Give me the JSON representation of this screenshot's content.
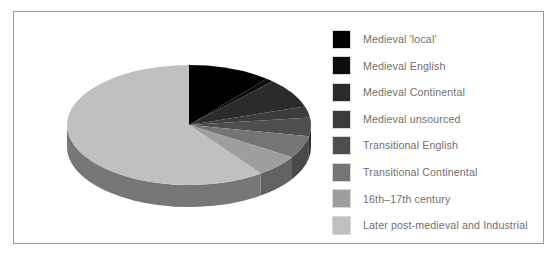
{
  "figure": {
    "border_color": "#9a9a9a",
    "background": "#ffffff"
  },
  "legend": {
    "position": "right",
    "items": [
      {
        "label": "Medieval 'local'",
        "color": "#000000"
      },
      {
        "label": "Medieval English",
        "color": "#0d0d0d"
      },
      {
        "label": "Medieval Continental",
        "color": "#2b2b2b"
      },
      {
        "label": "Medieval unsourced",
        "color": "#3c3c3c"
      },
      {
        "label": "Transitional English",
        "color": "#4e4e4e"
      },
      {
        "label": "Transitional Continental",
        "color": "#757575"
      },
      {
        "label": "16th–17th century",
        "color": "#9e9e9e"
      },
      {
        "label": "Later post-medieval and Industrial",
        "color": "#c0c0c0"
      }
    ]
  },
  "chart_data": {
    "type": "pie",
    "title": "",
    "subtitle": "",
    "xlabel": "",
    "ylabel": "",
    "three_d": true,
    "start_angle_deg": 0,
    "direction": "clockwise",
    "legend_position": "right",
    "grid": false,
    "categories": [
      "Medieval 'local'",
      "Medieval English",
      "Medieval Continental",
      "Medieval unsourced",
      "Transitional English",
      "Transitional Continental",
      "16th–17th century",
      "Later post-medieval and Industrial"
    ],
    "values": [
      11,
      1,
      8,
      3,
      5,
      6,
      6,
      60
    ],
    "units": "percent",
    "colors": [
      "#000000",
      "#0d0d0d",
      "#2b2b2b",
      "#3c3c3c",
      "#4e4e4e",
      "#757575",
      "#9e9e9e",
      "#c0c0c0"
    ],
    "geometry": {
      "center_x": 157,
      "center_y": 81,
      "radius_x": 122,
      "radius_y": 60,
      "depth": 22
    }
  }
}
